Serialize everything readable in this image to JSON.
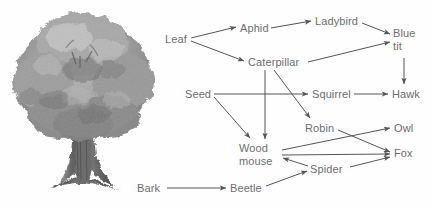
{
  "figure": {
    "background_color": "#fefefe",
    "text_color": "#6d6d6d",
    "line_color": "#555555"
  },
  "illustration": {
    "name": "oak-tree",
    "caption": "Grayscale illustration of a broad oak tree with dense canopy and a thick trunk with spreading roots"
  },
  "nodes": [
    {
      "id": "leaf",
      "label": "Leaf",
      "x": 165,
      "y": 33,
      "w": 26,
      "h": 13
    },
    {
      "id": "aphid",
      "label": "Aphid",
      "x": 240,
      "y": 22,
      "w": 30,
      "h": 13
    },
    {
      "id": "ladybird",
      "label": "Ladybird",
      "x": 315,
      "y": 15,
      "w": 45,
      "h": 13
    },
    {
      "id": "bluetit",
      "label": "Blue\ntit",
      "x": 393,
      "y": 27,
      "w": 28,
      "h": 26
    },
    {
      "id": "caterpillar",
      "label": "Caterpillar",
      "x": 248,
      "y": 56,
      "w": 58,
      "h": 13
    },
    {
      "id": "seed",
      "label": "Seed",
      "x": 185,
      "y": 88,
      "w": 28,
      "h": 13
    },
    {
      "id": "squirrel",
      "label": "Squirrel",
      "x": 312,
      "y": 88,
      "w": 41,
      "h": 13
    },
    {
      "id": "hawk",
      "label": "Hawk",
      "x": 392,
      "y": 88,
      "w": 31,
      "h": 13
    },
    {
      "id": "robin",
      "label": "Robin",
      "x": 305,
      "y": 122,
      "w": 31,
      "h": 13
    },
    {
      "id": "owl",
      "label": "Owl",
      "x": 394,
      "y": 122,
      "w": 24,
      "h": 13
    },
    {
      "id": "woodmouse",
      "label": "Wood\nmouse",
      "x": 239,
      "y": 142,
      "w": 41,
      "h": 26
    },
    {
      "id": "fox",
      "label": "Fox",
      "x": 394,
      "y": 147,
      "w": 23,
      "h": 13
    },
    {
      "id": "spider",
      "label": "Spider",
      "x": 310,
      "y": 163,
      "w": 36,
      "h": 13
    },
    {
      "id": "bark",
      "label": "Bark",
      "x": 137,
      "y": 182,
      "w": 27,
      "h": 13
    },
    {
      "id": "beetle",
      "label": "Beetle",
      "x": 230,
      "y": 182,
      "w": 34,
      "h": 13
    }
  ],
  "edges": [
    {
      "from": "leaf",
      "to": "aphid"
    },
    {
      "from": "leaf",
      "to": "caterpillar"
    },
    {
      "from": "aphid",
      "to": "ladybird"
    },
    {
      "from": "ladybird",
      "to": "bluetit"
    },
    {
      "from": "caterpillar",
      "to": "bluetit"
    },
    {
      "from": "caterpillar",
      "to": "robin"
    },
    {
      "from": "caterpillar",
      "to": "woodmouse"
    },
    {
      "from": "bluetit",
      "to": "hawk"
    },
    {
      "from": "seed",
      "to": "squirrel"
    },
    {
      "from": "seed",
      "to": "woodmouse"
    },
    {
      "from": "squirrel",
      "to": "hawk"
    },
    {
      "from": "robin",
      "to": "fox"
    },
    {
      "from": "woodmouse",
      "to": "owl"
    },
    {
      "from": "woodmouse",
      "to": "fox"
    },
    {
      "from": "spider",
      "to": "woodmouse"
    },
    {
      "from": "spider",
      "to": "fox"
    },
    {
      "from": "bark",
      "to": "beetle"
    },
    {
      "from": "beetle",
      "to": "spider"
    }
  ]
}
